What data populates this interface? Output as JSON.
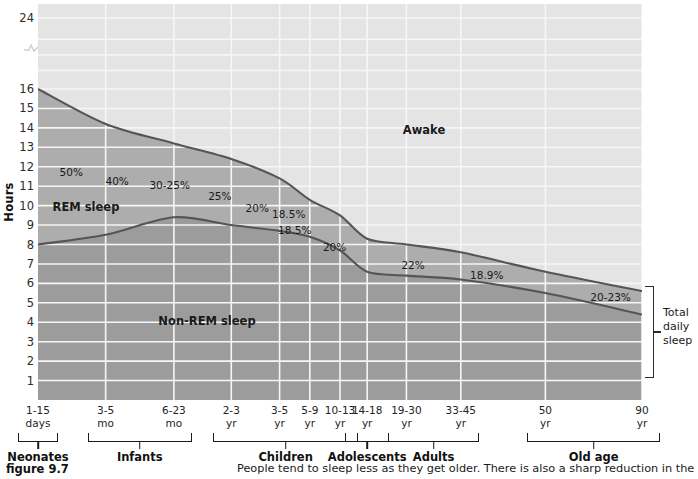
{
  "figure": {
    "number": "figure 9.7",
    "caption": "People tend to sleep less as they get older. There is also a sharp reduction in the"
  },
  "chart_data": {
    "type": "area",
    "title": "",
    "xlabel": "",
    "ylabel": "Hours",
    "ylim": [
      0,
      24
    ],
    "yticks": [
      1,
      2,
      3,
      4,
      5,
      6,
      7,
      8,
      9,
      10,
      11,
      12,
      13,
      14,
      15,
      16,
      24
    ],
    "y_axis_break": true,
    "y_axis_break_between": [
      16,
      24
    ],
    "grid": true,
    "legend_position": "in-plot",
    "categories": [
      "1-15 days",
      "3-5 mo",
      "6-23 mo",
      "2-3 yr",
      "3-5 yr",
      "5-9 yr",
      "10-13 yr",
      "14-18 yr",
      "19-30 yr",
      "33-45 yr",
      "50 yr",
      "90 yr"
    ],
    "series": [
      {
        "name": "Total daily sleep",
        "values": [
          16.0,
          14.2,
          13.2,
          12.4,
          11.4,
          10.3,
          9.5,
          8.3,
          8.0,
          7.6,
          6.6,
          5.6
        ]
      },
      {
        "name": "Non-REM sleep",
        "values": [
          8.0,
          8.5,
          9.4,
          9.0,
          8.7,
          8.4,
          7.7,
          6.6,
          6.4,
          6.2,
          5.5,
          4.4
        ]
      }
    ],
    "regions": [
      {
        "label": "Awake",
        "shade": "#e4e4e4"
      },
      {
        "label": "REM sleep",
        "shade": "#a8a8a8"
      },
      {
        "label": "Non-REM sleep",
        "shade": "#9a9a9a"
      }
    ],
    "annotations": [
      {
        "text": "50%",
        "x_frac": 0.012,
        "y_px": 172
      },
      {
        "text": "40%",
        "x_frac": 0.088,
        "y_px": 181
      },
      {
        "text": "30-25%",
        "x_frac": 0.175,
        "y_px": 185
      },
      {
        "text": "25%",
        "x_frac": 0.258,
        "y_px": 196
      },
      {
        "text": "20%",
        "x_frac": 0.32,
        "y_px": 208
      },
      {
        "text": "18.5%",
        "x_frac": 0.372,
        "y_px": 214
      },
      {
        "text": "18.5%",
        "x_frac": 0.382,
        "y_px": 230
      },
      {
        "text": "20%",
        "x_frac": 0.448,
        "y_px": 247
      },
      {
        "text": "22%",
        "x_frac": 0.578,
        "y_px": 265
      },
      {
        "text": "18.9%",
        "x_frac": 0.7,
        "y_px": 275
      },
      {
        "text": "20-23%",
        "x_frac": 0.905,
        "y_px": 297
      }
    ],
    "region_labels": [
      {
        "text": "Awake",
        "x_px": 424,
        "y_px": 130
      },
      {
        "text": "REM sleep",
        "x_px": 86,
        "y_px": 207
      },
      {
        "text": "Non-REM sleep",
        "x_px": 207,
        "y_px": 321
      }
    ],
    "colors": {
      "awake_fill": "#e4e4e4",
      "rem_fill": "#acacac",
      "nonrem_fill": "#9b9b9b",
      "curve": "#555555",
      "gridline": "#f4f4f4",
      "text": "#1a1a1a"
    }
  },
  "y_axis": {
    "label": "Hours",
    "ticks": [
      "24",
      "16",
      "15",
      "14",
      "13",
      "12",
      "11",
      "10",
      "9",
      "8",
      "7",
      "6",
      "5",
      "4",
      "3",
      "2",
      "1"
    ]
  },
  "x_axis": {
    "ticks": [
      {
        "line1": "1-15",
        "line2": "days"
      },
      {
        "line1": "3-5",
        "line2": "mo"
      },
      {
        "line1": "6-23",
        "line2": "mo"
      },
      {
        "line1": "2-3",
        "line2": "yr"
      },
      {
        "line1": "3-5",
        "line2": "yr"
      },
      {
        "line1": "5-9",
        "line2": "yr"
      },
      {
        "line1": "10-13",
        "line2": "yr"
      },
      {
        "line1": "14-18",
        "line2": "yr"
      },
      {
        "line1": "19-30",
        "line2": "yr"
      },
      {
        "line1": "33-45",
        "line2": "yr"
      },
      {
        "line1": "50",
        "line2": "yr"
      },
      {
        "line1": "90",
        "line2": "yr"
      }
    ],
    "groups": [
      {
        "name": "Neonates"
      },
      {
        "name": "Infants"
      },
      {
        "name": "Children"
      },
      {
        "name": "Adolescents"
      },
      {
        "name": "Adults"
      },
      {
        "name": "Old age"
      }
    ]
  },
  "annotations": {
    "total_daily_sleep": "Total\ndaily\nsleep",
    "total_daily_sleep_l1": "Total",
    "total_daily_sleep_l2": "daily",
    "total_daily_sleep_l3": "sleep"
  }
}
